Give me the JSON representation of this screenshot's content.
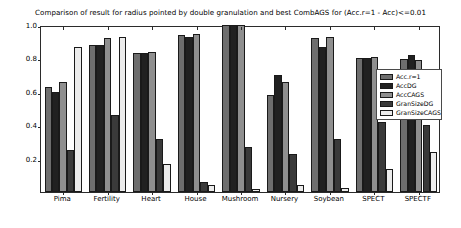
{
  "chart_data": {
    "type": "bar",
    "title": "Comparison of result for radius pointed by double granulation and best CombAGS for (Acc.r=1 - Acc)<=0.01",
    "xlabel": "",
    "ylabel": "",
    "ylim": [
      0.0,
      1.0
    ],
    "yticks": [
      "0.2",
      "0.4",
      "0.6",
      "0.8",
      "1.0"
    ],
    "ytick_values": [
      0.2,
      0.4,
      0.6,
      0.8,
      1.0
    ],
    "grid": false,
    "legend_position": "center-right",
    "categories": [
      "Pima",
      "Fertility",
      "Heart",
      "House",
      "Mushroom",
      "Nursery",
      "Soybean",
      "SPECT",
      "SPECTF"
    ],
    "series": [
      {
        "name": "Acc.r=1",
        "color": "#6e6e6e",
        "values": [
          0.63,
          0.88,
          0.835,
          0.94,
          1.0,
          0.58,
          0.92,
          0.805,
          0.795
        ]
      },
      {
        "name": "AccDG",
        "color": "#212121",
        "values": [
          0.6,
          0.88,
          0.835,
          0.93,
          1.0,
          0.7,
          0.87,
          0.805,
          0.82
        ]
      },
      {
        "name": "AccCAGS",
        "color": "#8f8f8f",
        "values": [
          0.66,
          0.92,
          0.84,
          0.945,
          1.0,
          0.66,
          0.93,
          0.81,
          0.79
        ]
      },
      {
        "name": "GranSizeDG",
        "color": "#3a3a3a",
        "values": [
          0.25,
          0.46,
          0.32,
          0.06,
          0.27,
          0.23,
          0.32,
          0.42,
          0.4
        ]
      },
      {
        "name": "GranSizeCAGS",
        "color": "#ececec",
        "values": [
          0.87,
          0.93,
          0.17,
          0.04,
          0.02,
          0.04,
          0.025,
          0.14,
          0.24
        ]
      }
    ]
  }
}
